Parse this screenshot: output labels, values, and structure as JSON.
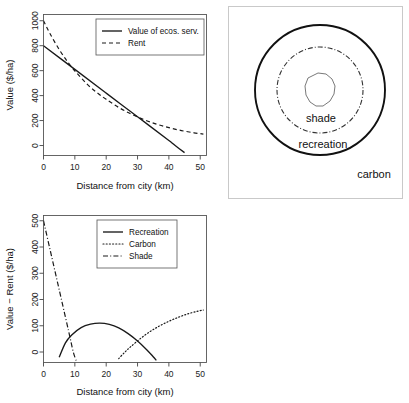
{
  "figure": {
    "panels": [
      "value-vs-rent",
      "ecosystem-service-zones",
      "surplus-by-service"
    ]
  },
  "chart_data": [
    {
      "id": "value-vs-rent",
      "type": "line",
      "title": "",
      "xlabel": "Distance from city (km)",
      "ylabel": "Value ($/ha)",
      "xlim": [
        0,
        52
      ],
      "ylim": [
        -80,
        1050
      ],
      "xticks": [
        0,
        10,
        20,
        30,
        40,
        50
      ],
      "yticks": [
        0,
        200,
        400,
        600,
        800,
        1000
      ],
      "grid": false,
      "legend_position": "top-right",
      "series": [
        {
          "name": "Value of ecos. serv.",
          "style": "solid",
          "x": [
            0,
            10,
            20,
            30,
            40,
            42,
            45
          ],
          "values": [
            800,
            610,
            420,
            230,
            40,
            0,
            -57
          ]
        },
        {
          "name": "Rent",
          "style": "dashed",
          "x": [
            0,
            2,
            5,
            8,
            11,
            14,
            17,
            20,
            24,
            28,
            32,
            36,
            40,
            44,
            48,
            51
          ],
          "values": [
            1000,
            900,
            770,
            660,
            570,
            490,
            425,
            370,
            305,
            252,
            208,
            172,
            143,
            120,
            102,
            92
          ]
        }
      ]
    },
    {
      "id": "surplus-by-service",
      "type": "line",
      "title": "",
      "xlabel": "Distance from city (km)",
      "ylabel": "Value − Rent ($/ha)",
      "xlim": [
        0,
        52
      ],
      "ylim": [
        -40,
        520
      ],
      "xticks": [
        0,
        10,
        20,
        30,
        40,
        50
      ],
      "yticks": [
        0,
        100,
        200,
        300,
        400,
        500
      ],
      "grid": false,
      "legend_position": "top-center",
      "series": [
        {
          "name": "Recreation",
          "style": "solid",
          "x": [
            5,
            7,
            9,
            12,
            15,
            18,
            21,
            24,
            27,
            30,
            33,
            35,
            36
          ],
          "values": [
            -20,
            35,
            65,
            93,
            106,
            110,
            105,
            92,
            70,
            42,
            8,
            -18,
            -32
          ]
        },
        {
          "name": "Carbon",
          "style": "dotted",
          "x": [
            24,
            26,
            28,
            31,
            34,
            37,
            40,
            43,
            46,
            49,
            51
          ],
          "values": [
            -25,
            0,
            22,
            52,
            78,
            99,
            117,
            132,
            145,
            155,
            160
          ]
        },
        {
          "name": "Shade",
          "style": "dashdot",
          "x": [
            0,
            2,
            4,
            6,
            8,
            9.5,
            10.5
          ],
          "values": [
            500,
            395,
            290,
            185,
            80,
            0,
            -35
          ]
        }
      ]
    }
  ],
  "diagram": {
    "id": "ecosystem-service-zones",
    "labels": {
      "inner": "shade",
      "middle": "recreation",
      "outer": "carbon"
    },
    "rings": [
      {
        "name": "carbon-boundary",
        "style": "solid",
        "radius": 65
      },
      {
        "name": "recreation-boundary",
        "style": "dash-dot",
        "radius": 43
      },
      {
        "name": "city-core",
        "style": "thin-outline",
        "radius": 17
      }
    ]
  }
}
